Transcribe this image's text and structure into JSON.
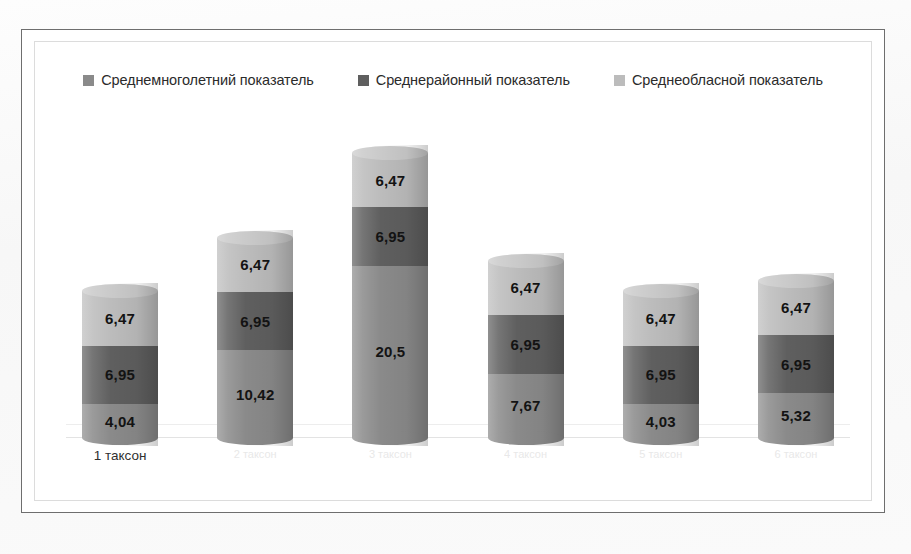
{
  "chart_data": {
    "type": "bar",
    "subtype": "stacked-cylinder",
    "title": "",
    "xlabel": "",
    "ylabel": "",
    "grid": true,
    "legend_position": "top",
    "categories": [
      "1 таксон",
      "2 таксон",
      "3 таксон",
      "4 таксон",
      "5 таксон",
      "6 таксон"
    ],
    "series": [
      {
        "name": "Среднемноголетний показатель",
        "color": "#8a8a8a",
        "values": [
          4.04,
          10.42,
          20.5,
          7.67,
          4.03,
          5.32
        ],
        "labels": [
          "4,04",
          "10,42",
          "20,5",
          "7,67",
          "4,03",
          "5,32"
        ]
      },
      {
        "name": "Среднерайонный показатель",
        "color": "#5f5f5f",
        "values": [
          6.95,
          6.95,
          6.95,
          6.95,
          6.95,
          6.95
        ],
        "labels": [
          "6,95",
          "6,95",
          "6,95",
          "6,95",
          "6,95",
          "6,95"
        ]
      },
      {
        "name": "Среднеобласной показатель",
        "color": "#bcbcbc",
        "values": [
          6.47,
          6.47,
          6.47,
          6.47,
          6.47,
          6.47
        ],
        "labels": [
          "6,47",
          "6,47",
          "6,47",
          "6,47",
          "6,47",
          "6,47"
        ]
      }
    ],
    "totals": [
      17.46,
      23.84,
      33.92,
      21.09,
      17.45,
      18.74
    ],
    "ylim": [
      0,
      36
    ]
  },
  "legend": {
    "items": [
      {
        "label": "Среднемноголетний показатель",
        "color": "#8a8a8a"
      },
      {
        "label": "Среднерайонный показатель",
        "color": "#5f5f5f"
      },
      {
        "label": "Среднеобласной показатель",
        "color": "#bcbcbc"
      }
    ]
  },
  "xaxis": {
    "ticks": [
      {
        "label": "1 таксон",
        "legible": true
      },
      {
        "label": "2 таксон",
        "legible": false
      },
      {
        "label": "3 таксон",
        "legible": false
      },
      {
        "label": "4 таксон",
        "legible": false
      },
      {
        "label": "5 таксон",
        "legible": false
      },
      {
        "label": "6 таксон",
        "legible": false
      }
    ]
  },
  "bars": [
    {
      "category": "1 таксон",
      "segments": [
        {
          "series": "Среднеобласной показатель",
          "label": "6,47",
          "value": 6.47,
          "color": "#bcbcbc"
        },
        {
          "series": "Среднерайонный показатель",
          "label": "6,95",
          "value": 6.95,
          "color": "#5f5f5f"
        },
        {
          "series": "Среднемноголетний показатель",
          "label": "4,04",
          "value": 4.04,
          "color": "#8a8a8a"
        }
      ]
    },
    {
      "category": "2 таксон",
      "segments": [
        {
          "series": "Среднеобласной показатель",
          "label": "6,47",
          "value": 6.47,
          "color": "#bcbcbc"
        },
        {
          "series": "Среднерайонный показатель",
          "label": "6,95",
          "value": 6.95,
          "color": "#5f5f5f"
        },
        {
          "series": "Среднемноголетний показатель",
          "label": "10,42",
          "value": 10.42,
          "color": "#8a8a8a"
        }
      ]
    },
    {
      "category": "3 таксон",
      "segments": [
        {
          "series": "Среднеобласной показатель",
          "label": "6,47",
          "value": 6.47,
          "color": "#bcbcbc"
        },
        {
          "series": "Среднерайонный показатель",
          "label": "6,95",
          "value": 6.95,
          "color": "#5f5f5f"
        },
        {
          "series": "Среднемноголетний показатель",
          "label": "20,5",
          "value": 20.5,
          "color": "#8a8a8a"
        }
      ]
    },
    {
      "category": "4 таксон",
      "segments": [
        {
          "series": "Среднеобласной показатель",
          "label": "6,47",
          "value": 6.47,
          "color": "#bcbcbc"
        },
        {
          "series": "Среднерайонный показатель",
          "label": "6,95",
          "value": 6.95,
          "color": "#5f5f5f"
        },
        {
          "series": "Среднемноголетний показатель",
          "label": "7,67",
          "value": 7.67,
          "color": "#8a8a8a"
        }
      ]
    },
    {
      "category": "5 таксон",
      "segments": [
        {
          "series": "Среднеобласной показатель",
          "label": "6,47",
          "value": 6.47,
          "color": "#bcbcbc"
        },
        {
          "series": "Среднерайонный показатель",
          "label": "6,95",
          "value": 6.95,
          "color": "#5f5f5f"
        },
        {
          "series": "Среднемноголетний показатель",
          "label": "4,03",
          "value": 4.03,
          "color": "#8a8a8a"
        }
      ]
    },
    {
      "category": "6 таксон",
      "segments": [
        {
          "series": "Среднеобласной показатель",
          "label": "6,47",
          "value": 6.47,
          "color": "#bcbcbc"
        },
        {
          "series": "Среднерайонный показатель",
          "label": "6,95",
          "value": 6.95,
          "color": "#5f5f5f"
        },
        {
          "series": "Среднемноголетний показатель",
          "label": "5,32",
          "value": 5.32,
          "color": "#8a8a8a"
        }
      ]
    }
  ]
}
